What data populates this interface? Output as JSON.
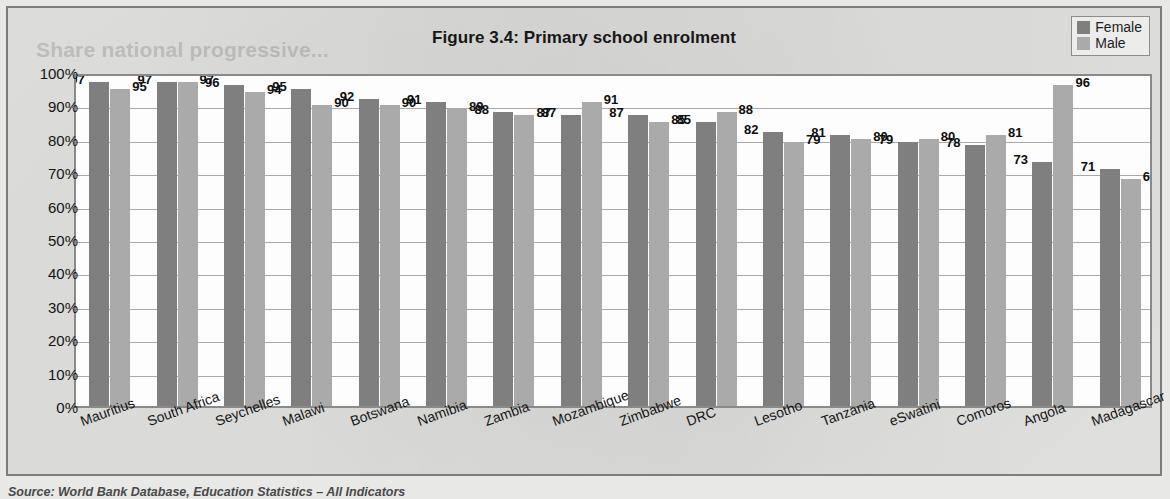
{
  "figure": {
    "title": "Figure 3.4: Primary school enrolment",
    "bleed_through_text": "Share national progressive...",
    "source": "Source: World Bank Database, Education Statistics – All Indicators"
  },
  "legend": {
    "female_label": "Female",
    "male_label": "Male",
    "female_color": "#7f7f7f",
    "male_color": "#aaaaaa"
  },
  "axis": {
    "y_ticks": [
      "100%",
      "90%",
      "80%",
      "70%",
      "60%",
      "50%",
      "40%",
      "30%",
      "20%",
      "10%",
      "0%"
    ]
  },
  "chart_data": {
    "type": "bar",
    "title": "Figure 3.4: Primary school enrolment",
    "xlabel": "",
    "ylabel": "",
    "ylim": [
      0,
      100
    ],
    "ytick_format": "percent",
    "grid": true,
    "legend_position": "top-right",
    "categories": [
      "Mauritius",
      "South Africa",
      "Seychelles",
      "Malawi",
      "Botswana",
      "Namibia",
      "Zambia",
      "Mozambique",
      "Zimbabwe",
      "DRC",
      "Lesotho",
      "Tanzania",
      "eSwatini",
      "Comoros",
      "Angola",
      "Madagascar"
    ],
    "series": [
      {
        "name": "Female",
        "color": "#7f7f7f",
        "values": [
          97,
          97,
          96,
          95,
          92,
          91,
          88,
          87,
          87,
          85,
          82,
          81,
          79,
          78,
          73,
          71
        ]
      },
      {
        "name": "Male",
        "color": "#aaaaaa",
        "values": [
          95,
          97,
          94,
          90,
          90,
          89,
          87,
          91,
          85,
          88,
          79,
          80,
          80,
          81,
          96,
          68
        ]
      }
    ]
  }
}
